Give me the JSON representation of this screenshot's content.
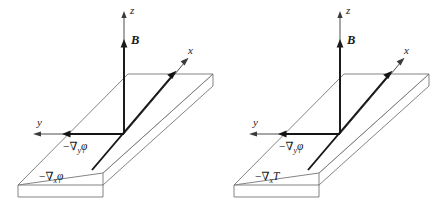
{
  "figure": {
    "title": "",
    "background_color": "#ffffff",
    "panel_count": 2,
    "colors": {
      "slab_outline": "#6e6e6e",
      "axis": "#3a3a3a",
      "gradient_arrow": "#151515",
      "bfield_arrow": "#1b1b1b",
      "text": "#1a1a1a"
    }
  },
  "panels": [
    {
      "id": "left",
      "name": "electric-potential-gradient-panel",
      "axes": [
        {
          "key": "z",
          "label": "z",
          "direction": "up"
        },
        {
          "key": "x",
          "label": "x",
          "direction": "up-right"
        },
        {
          "key": "y",
          "label": "y",
          "direction": "left"
        }
      ],
      "field": {
        "label": "B",
        "description": "magnetic-field",
        "direction": "up"
      },
      "gradients": [
        {
          "key": "grad_y",
          "minus": "−",
          "nabla": "∇",
          "subscript": "y",
          "quantity": "φ",
          "label": "−∇yφ",
          "direction": "left"
        },
        {
          "key": "grad_x",
          "minus": "−",
          "nabla": "∇",
          "subscript": "x",
          "quantity": "φ",
          "label": "−∇xφ",
          "direction": "up-right"
        }
      ]
    },
    {
      "id": "right",
      "name": "temperature-gradient-panel",
      "axes": [
        {
          "key": "z",
          "label": "z",
          "direction": "up"
        },
        {
          "key": "x",
          "label": "x",
          "direction": "up-right"
        },
        {
          "key": "y",
          "label": "y",
          "direction": "left"
        }
      ],
      "field": {
        "label": "B",
        "description": "magnetic-field",
        "direction": "up"
      },
      "gradients": [
        {
          "key": "grad_y",
          "minus": "−",
          "nabla": "∇",
          "subscript": "y",
          "quantity": "φ",
          "label": "−∇yφ",
          "direction": "left"
        },
        {
          "key": "grad_x",
          "minus": "−",
          "nabla": "∇",
          "subscript": "x",
          "quantity": "T",
          "label": "−∇xT",
          "direction": "up-right"
        }
      ]
    }
  ]
}
